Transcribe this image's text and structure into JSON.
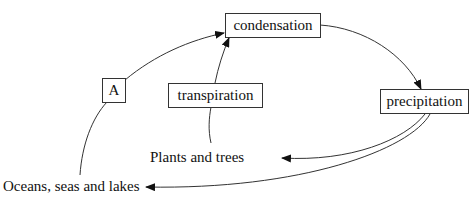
{
  "diagram": {
    "type": "water-cycle",
    "nodes": {
      "condensation": {
        "label": "condensation",
        "boxed": true
      },
      "a": {
        "label": "A",
        "boxed": true
      },
      "transpiration": {
        "label": "transpiration",
        "boxed": true
      },
      "precipitation": {
        "label": "precipitation",
        "boxed": true
      },
      "plants": {
        "label": "Plants and trees",
        "boxed": false
      },
      "oceans": {
        "label": "Oceans, seas and lakes",
        "boxed": false
      }
    },
    "edges": [
      {
        "from": "oceans",
        "to": "a",
        "arrow": false
      },
      {
        "from": "a",
        "to": "condensation",
        "arrow": true
      },
      {
        "from": "plants",
        "to": "transpiration",
        "arrow": false
      },
      {
        "from": "transpiration",
        "to": "condensation",
        "arrow": true
      },
      {
        "from": "condensation",
        "to": "precipitation",
        "arrow": true
      },
      {
        "from": "precipitation",
        "to": "plants",
        "arrow": true
      },
      {
        "from": "precipitation",
        "to": "oceans",
        "arrow": true
      }
    ],
    "colors": {
      "line": "#333333",
      "text": "#111111",
      "background": "#ffffff"
    }
  }
}
